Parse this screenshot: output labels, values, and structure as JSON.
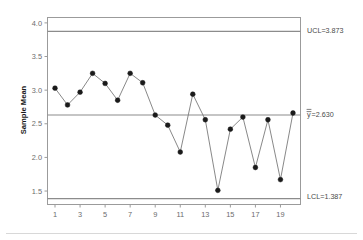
{
  "chart_data": {
    "type": "line",
    "title": "",
    "subtitle": "",
    "xlabel": "",
    "ylabel": "Sample Mean",
    "x": [
      1,
      2,
      3,
      4,
      5,
      6,
      7,
      8,
      9,
      10,
      11,
      12,
      13,
      14,
      15,
      16,
      17,
      18,
      19,
      20
    ],
    "values": [
      3.03,
      2.78,
      2.97,
      3.25,
      3.1,
      2.85,
      3.25,
      3.11,
      2.63,
      2.48,
      2.08,
      2.94,
      2.56,
      1.51,
      2.42,
      2.6,
      1.85,
      2.56,
      1.67,
      2.66
    ],
    "series": [
      {
        "name": "Sample Mean",
        "values": [
          3.03,
          2.78,
          2.97,
          3.25,
          3.1,
          2.85,
          3.25,
          3.11,
          2.63,
          2.48,
          2.08,
          2.94,
          2.56,
          1.51,
          2.42,
          2.6,
          1.85,
          2.56,
          1.67,
          2.66
        ]
      }
    ],
    "xlim": [
      0.4,
      20.6
    ],
    "ylim": [
      1.3,
      4.08
    ],
    "ytick_labels": [
      "4.0",
      "3.5",
      "3.0",
      "2.5",
      "2.0",
      "1.5"
    ],
    "ytick_values": [
      4.0,
      3.5,
      3.0,
      2.5,
      2.0,
      1.5
    ],
    "xtick_labels": [
      "1",
      "3",
      "5",
      "7",
      "9",
      "11",
      "13",
      "15",
      "17",
      "19"
    ],
    "xtick_values": [
      1,
      3,
      5,
      7,
      9,
      11,
      13,
      15,
      17,
      19
    ],
    "grid": false,
    "legend": "none",
    "reference_lines": [
      {
        "name": "UCL",
        "value": 3.873,
        "label": "UCL=3.873"
      },
      {
        "name": "CL",
        "value": 2.63,
        "label": "y=2.630",
        "label_prefix": "y",
        "label_suffix": "=2.630",
        "overbar": "double"
      },
      {
        "name": "LCL",
        "value": 1.387,
        "label": "LCL=1.387"
      }
    ],
    "marker_color": "#1a1a1a",
    "line_color": "#7a7a7a",
    "limit_line_color": "#8c8c8c",
    "frame_color": "#9b9b9b"
  },
  "axis": {
    "y_title": "Sample Mean",
    "y_ticks": [
      "4.0",
      "3.5",
      "3.0",
      "2.5",
      "2.0",
      "1.5"
    ],
    "x_ticks": [
      "1",
      "3",
      "5",
      "7",
      "9",
      "11",
      "13",
      "15",
      "17",
      "19"
    ]
  },
  "limits": {
    "ucl_label": "UCL=3.873",
    "cl_label_symbol": "y",
    "cl_label_value": "=2.630",
    "lcl_label": "LCL=1.387"
  }
}
